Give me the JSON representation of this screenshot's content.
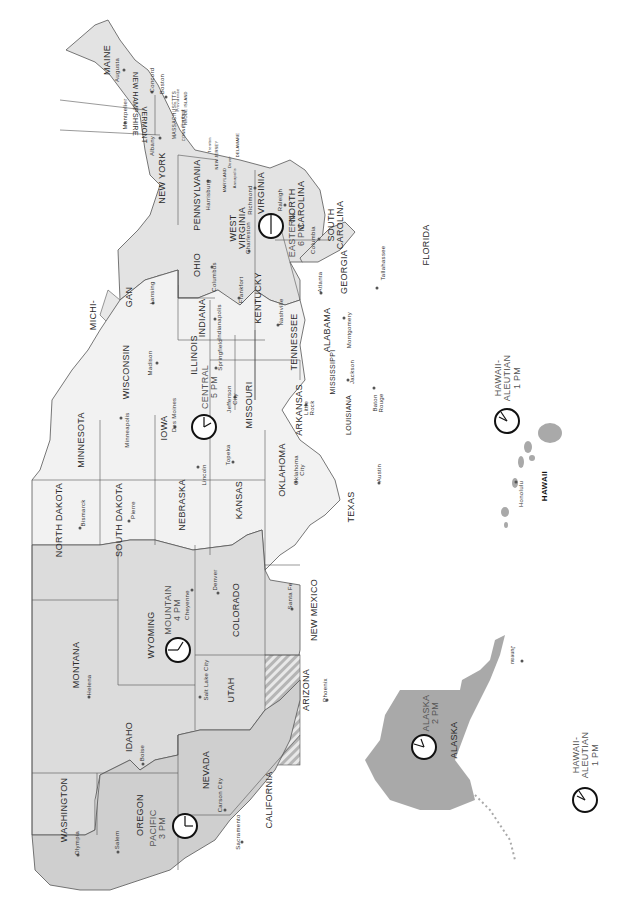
{
  "map": {
    "title": "United States Time Zones",
    "orientation": "rotated 90 degrees clockwise",
    "colors": {
      "pacific_fill": "#cfcfcf",
      "mountain_fill": "#dcdcdc",
      "central_fill": "#f2f2f2",
      "eastern_fill": "#e3e3e3",
      "alaska_fill": "#a9a9a9",
      "hawaii_fill": "#a9a9a9",
      "border": "#555555",
      "clock_stroke": "#111111"
    },
    "time_zones": [
      {
        "id": "pacific",
        "line1": "PACIFIC",
        "line2": "3 PM"
      },
      {
        "id": "mountain",
        "line1": "MOUNTAIN",
        "line2": "4 PM"
      },
      {
        "id": "central",
        "line1": "CENTRAL",
        "line2": "5 PM"
      },
      {
        "id": "eastern",
        "line1": "EASTERN",
        "line2": "6 PM"
      },
      {
        "id": "alaska",
        "line1": "ALASKA",
        "line2": "2 PM"
      },
      {
        "id": "hawaii_aleutian_1",
        "line1": "HAWAII-",
        "line2": "ALEUTIAN",
        "line3": "1 PM"
      },
      {
        "id": "hawaii_aleutian_2",
        "line1": "HAWAII-",
        "line2": "ALEUTIAN",
        "line3": "1 PM"
      }
    ],
    "states": {
      "maine": "MAINE",
      "new_hampshire": "NEW HAMPSHIRE",
      "vermont": "VERMONT",
      "massachusetts": "MASSACHUSETTS",
      "connecticut": "CONNECTICUT",
      "rhode_island": "RHODE ISLAND",
      "new_york": "NEW YORK",
      "new_jersey": "NEW JERSEY",
      "pennsylvania": "PENNSYLVANIA",
      "delaware": "DELAWARE",
      "maryland": "MARYLAND",
      "virginia": "VIRGINIA",
      "west_virginia_1": "WEST",
      "west_virginia_2": "VIRGINIA",
      "north_carolina_1": "NORTH",
      "north_carolina_2": "CAROLINA",
      "south_carolina_1": "SOUTH",
      "south_carolina_2": "CAROLINA",
      "georgia": "GEORGIA",
      "florida": "FLORIDA",
      "ohio": "OHIO",
      "michigan_1": "MICHI-",
      "michigan_2": "GAN",
      "indiana": "INDIANA",
      "kentucky": "KENTUCKY",
      "tennessee": "TENNESSEE",
      "alabama": "ALABAMA",
      "mississippi": "MISSISSIPPI",
      "illinois": "ILLINOIS",
      "wisconsin": "WISCONSIN",
      "minnesota": "MINNESOTA",
      "iowa": "IOWA",
      "missouri": "MISSOURI",
      "arkansas": "ARKANSAS",
      "louisiana": "LOUISIANA",
      "texas": "TEXAS",
      "oklahoma": "OKLAHOMA",
      "kansas": "KANSAS",
      "nebraska": "NEBRASKA",
      "south_dakota": "SOUTH DAKOTA",
      "north_dakota": "NORTH DAKOTA",
      "montana": "MONTANA",
      "wyoming": "WYOMING",
      "colorado": "COLORADO",
      "new_mexico": "NEW MEXICO",
      "arizona": "ARIZONA",
      "utah": "UTAH",
      "idaho": "IDAHO",
      "nevada": "NEVADA",
      "washington": "WASHINGTON",
      "oregon": "OREGON",
      "california": "CALIFORNIA",
      "alaska": "ALASKA",
      "hawaii": "HAWAII"
    },
    "capitals": {
      "augusta": "Augusta",
      "concord": "Concord",
      "boston": "Boston",
      "providence": "Providence",
      "hartford": "Hartford",
      "montpelier": "Montpelier",
      "albany": "Albany",
      "trenton": "Trenton",
      "dover": "Dover",
      "annapolis": "Annapolis",
      "harrisburg": "Harrisburg",
      "richmond": "Richmond",
      "raleigh": "Raleigh",
      "charleston": "Charleston",
      "columbia": "Columbia",
      "atlanta": "Atlanta",
      "tallahassee": "Tallahassee",
      "columbus": "Columbus",
      "lansing": "Lansing",
      "indianapolis": "Indianapolis",
      "frankfort": "Frankfort",
      "nashville": "Nashville",
      "montgomery": "Montgomery",
      "jackson": "Jackson",
      "springfield": "Springfield",
      "madison": "Madison",
      "minneapolis": "Minneapolis",
      "des_moines": "Des Moines",
      "jefferson_city_1": "Jefferson",
      "jefferson_city_2": "City",
      "little_rock_1": "Little",
      "little_rock_2": "Rock",
      "baton_rouge_1": "Baton",
      "baton_rouge_2": "Rouge",
      "austin": "Austin",
      "oklahoma_city_1": "Oklahoma",
      "oklahoma_city_2": "City",
      "topeka": "Topeka",
      "lincoln": "Lincoln",
      "pierre": "Pierre",
      "bismarck": "Bismarck",
      "helena": "Helena",
      "cheyenne": "Cheyenne",
      "denver": "Denver",
      "santa_fe": "Santa Fe",
      "phoenix": "Phoenix",
      "salt_lake_city": "Salt Lake City",
      "boise": "Boise",
      "carson_city": "Carson City",
      "sacramento": "Sacramento",
      "olympia": "Olympia",
      "salem": "Salem",
      "juneau": "Juneau",
      "honolulu": "Honolulu"
    }
  }
}
